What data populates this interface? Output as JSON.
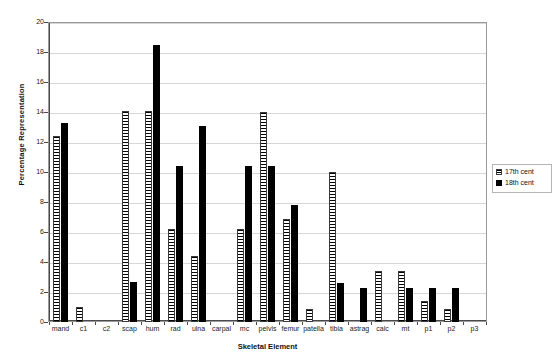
{
  "chart_data": {
    "type": "bar",
    "title": "",
    "xlabel": "Skeletal Element",
    "ylabel": "Percentage Representation",
    "ylim": [
      0,
      20
    ],
    "ytick_step": 2,
    "yticks": [
      0,
      2,
      4,
      6,
      8,
      10,
      12,
      14,
      16,
      18,
      20
    ],
    "grid": true,
    "legend_position": "right",
    "categories": [
      "mand",
      "c1",
      "c2",
      "scap",
      "hum",
      "rad",
      "ulna",
      "carpal",
      "mc",
      "pelvis",
      "femur",
      "patella",
      "tibia",
      "astrag",
      "calc",
      "mt",
      "p1",
      "p2",
      "p3"
    ],
    "series": [
      {
        "name": "17th cent",
        "fill": "horizontal-hatch",
        "values": [
          12.4,
          1.0,
          0,
          14.1,
          14.1,
          6.2,
          4.4,
          0,
          6.2,
          14.0,
          6.9,
          0.9,
          10.0,
          0,
          3.4,
          3.4,
          1.4,
          0.9,
          0
        ]
      },
      {
        "name": "18th cent",
        "fill": "solid-black",
        "values": [
          13.25,
          0,
          0,
          2.7,
          18.5,
          10.4,
          13.05,
          0,
          10.4,
          10.4,
          7.8,
          0,
          2.6,
          2.3,
          0,
          2.3,
          2.3,
          2.3,
          0
        ]
      }
    ]
  },
  "legend": {
    "entries": [
      {
        "label": "17th cent"
      },
      {
        "label": "18th cent"
      }
    ]
  },
  "colors": {
    "series_17_cent": "#ffffff",
    "series_18_cent": "#000000",
    "gridline": "#d6d6d6",
    "axis": "#4a4a4a",
    "plot_border": "#9a9a9a",
    "background": "#ffffff"
  }
}
